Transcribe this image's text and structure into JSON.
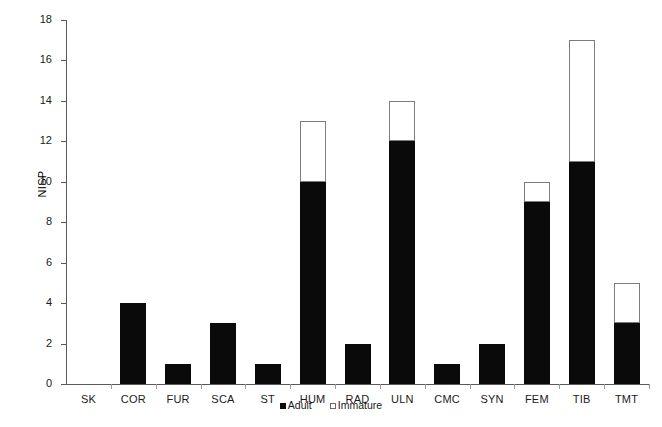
{
  "chart_data": {
    "type": "bar",
    "stacked": true,
    "title": "",
    "xlabel": "",
    "ylabel": "NISP",
    "ylim": [
      0,
      18
    ],
    "ytick_step": 2,
    "yticks": [
      0,
      2,
      4,
      6,
      8,
      10,
      12,
      14,
      16,
      18
    ],
    "grid": false,
    "legend_position": "bottom-center",
    "categories": [
      "SK",
      "COR",
      "FUR",
      "SCA",
      "ST",
      "HUM",
      "RAD",
      "ULN",
      "CMC",
      "SYN",
      "FEM",
      "TIB",
      "TMT"
    ],
    "series": [
      {
        "name": "Adult",
        "color": "#0a0a0a",
        "values": [
          0,
          4,
          1,
          3,
          1,
          10,
          2,
          12,
          1,
          2,
          9,
          11,
          3
        ]
      },
      {
        "name": "Immature",
        "color": "#ffffff",
        "values": [
          0,
          0,
          0,
          0,
          0,
          3,
          0,
          2,
          0,
          0,
          1,
          6,
          2
        ]
      }
    ],
    "totals": [
      0,
      4,
      1,
      3,
      1,
      13,
      2,
      14,
      1,
      2,
      10,
      17,
      5
    ]
  },
  "legend": {
    "entries": [
      {
        "label": "Adult",
        "swatch": "filled"
      },
      {
        "label": "Immature",
        "swatch": "open"
      }
    ]
  },
  "colors": {
    "adult": "#0a0a0a",
    "immature": "#ffffff",
    "immature_border": "#7d7d7d",
    "axis": "#5a5a5a",
    "text": "#1a1a1a",
    "background": "#ffffff"
  }
}
